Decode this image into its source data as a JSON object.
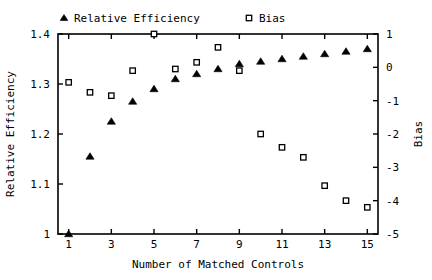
{
  "chart_data": {
    "type": "scatter",
    "title": "",
    "xlabel": "Number of Matched Controls",
    "ylabel": "Relative Efficiency",
    "y2label": "Bias",
    "grid": false,
    "legend_position": "top",
    "xlim": [
      0.5,
      15.5
    ],
    "ylim": [
      1.0,
      1.4
    ],
    "y2lim": [
      -5,
      1
    ],
    "x": [
      1,
      2,
      3,
      4,
      5,
      6,
      7,
      8,
      9,
      10,
      11,
      12,
      13,
      14,
      15
    ],
    "xticks": [
      1,
      3,
      5,
      7,
      9,
      11,
      13,
      15
    ],
    "xtick_labels": [
      "1",
      "3",
      "5",
      "7",
      "9",
      "11",
      "13",
      "15"
    ],
    "yticks": [
      1.0,
      1.1,
      1.2,
      1.3,
      1.4
    ],
    "ytick_labels": [
      "1",
      "1.1",
      "1.2",
      "1.3",
      "1.4"
    ],
    "y2ticks": [
      -5,
      -4,
      -3,
      -2,
      -1,
      0,
      1
    ],
    "y2tick_labels": [
      "-5",
      "-4",
      "-3",
      "-2",
      "-1",
      "0",
      "1"
    ],
    "series": [
      {
        "name": "Relative Efficiency",
        "marker": "triangle",
        "axis": "left",
        "values": [
          1.0,
          1.155,
          1.225,
          1.265,
          1.29,
          1.31,
          1.32,
          1.33,
          1.34,
          1.345,
          1.35,
          1.355,
          1.36,
          1.365,
          1.37
        ]
      },
      {
        "name": "Bias",
        "marker": "square",
        "axis": "right",
        "values": [
          -0.45,
          -0.75,
          -0.85,
          -0.1,
          1.0,
          -0.05,
          0.15,
          0.6,
          -0.1,
          -2.0,
          -2.4,
          -2.7,
          -3.55,
          -4.0,
          -4.2
        ]
      }
    ]
  },
  "legend": {
    "items": [
      {
        "label": "Relative Efficiency",
        "marker": "triangle"
      },
      {
        "label": "Bias",
        "marker": "square"
      }
    ]
  }
}
